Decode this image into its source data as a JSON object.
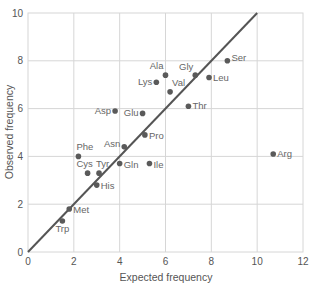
{
  "chart_data": {
    "type": "scatter",
    "title": "",
    "xlabel": "Expected frequency",
    "ylabel": "Observed frequency",
    "xlim": [
      0,
      12
    ],
    "ylim": [
      0,
      10
    ],
    "x_ticks": [
      0,
      2,
      4,
      6,
      8,
      10,
      12
    ],
    "y_ticks": [
      0,
      2,
      4,
      6,
      8,
      10
    ],
    "grid": true,
    "legend": null,
    "reference_line": {
      "label": "y = x",
      "from": [
        0,
        0
      ],
      "to": [
        10,
        10
      ]
    },
    "points": [
      {
        "label": "Trp",
        "x": 1.5,
        "y": 1.3
      },
      {
        "label": "Met",
        "x": 1.8,
        "y": 1.8
      },
      {
        "label": "His",
        "x": 3.0,
        "y": 2.8
      },
      {
        "label": "Cys",
        "x": 2.6,
        "y": 3.3
      },
      {
        "label": "Tyr",
        "x": 3.1,
        "y": 3.3
      },
      {
        "label": "Phe",
        "x": 2.2,
        "y": 4.0
      },
      {
        "label": "Gln",
        "x": 4.0,
        "y": 3.7
      },
      {
        "label": "Asn",
        "x": 4.2,
        "y": 4.4
      },
      {
        "label": "Ile",
        "x": 5.3,
        "y": 3.7
      },
      {
        "label": "Pro",
        "x": 5.1,
        "y": 4.9
      },
      {
        "label": "Asp",
        "x": 3.8,
        "y": 5.9
      },
      {
        "label": "Glu",
        "x": 5.0,
        "y": 5.8
      },
      {
        "label": "Thr",
        "x": 7.0,
        "y": 6.1
      },
      {
        "label": "Val",
        "x": 6.2,
        "y": 6.7
      },
      {
        "label": "Lys",
        "x": 5.6,
        "y": 7.1
      },
      {
        "label": "Ala",
        "x": 6.0,
        "y": 7.4
      },
      {
        "label": "Gly",
        "x": 7.3,
        "y": 7.4
      },
      {
        "label": "Leu",
        "x": 7.9,
        "y": 7.3
      },
      {
        "label": "Ser",
        "x": 8.7,
        "y": 8.0
      },
      {
        "label": "Arg",
        "x": 10.7,
        "y": 4.1
      }
    ]
  },
  "colors": {
    "point": "#5a5a5a",
    "line": "#555555",
    "grid": "#d6d6d6",
    "axis_text": "#555555",
    "label_text": "#666666"
  }
}
